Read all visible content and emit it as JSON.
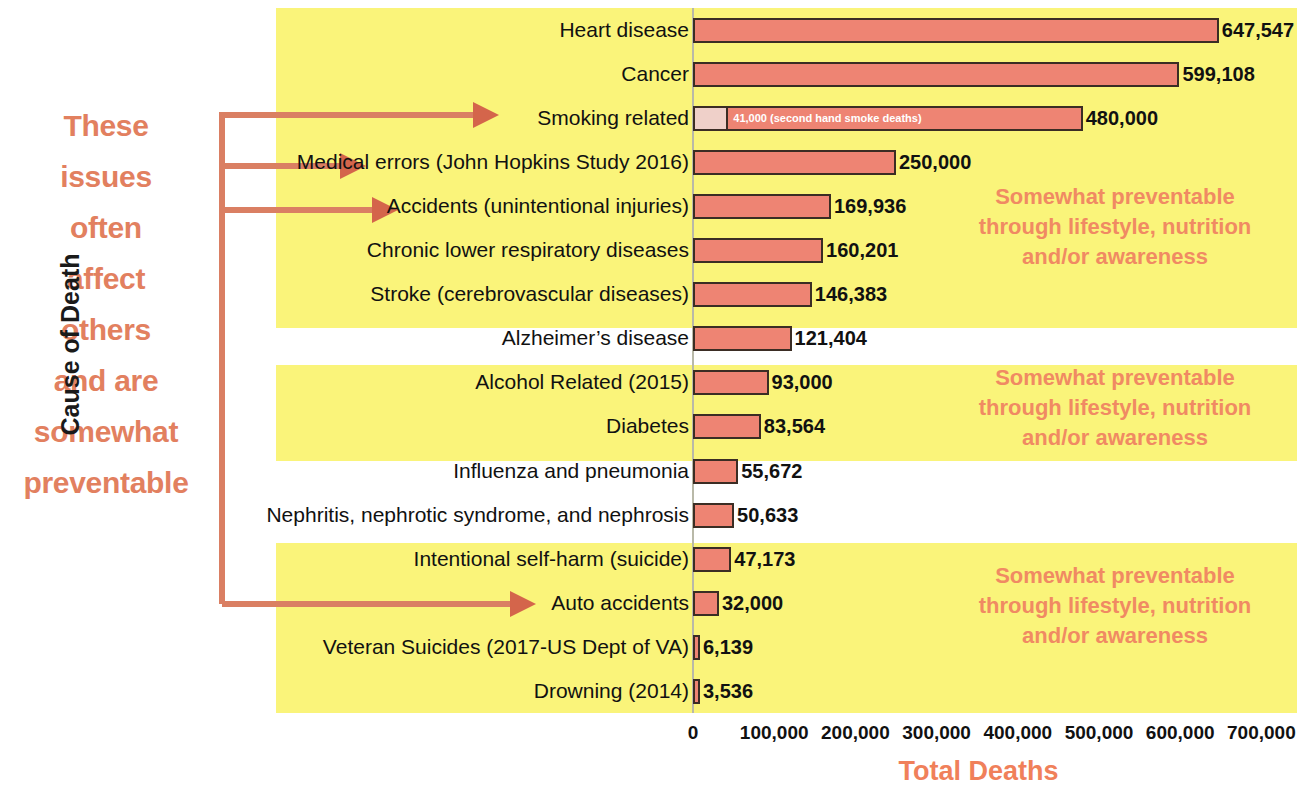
{
  "chart_data": {
    "type": "bar",
    "orientation": "horizontal",
    "title": "",
    "xlabel": "Total Deaths",
    "ylabel": "Cause of Death",
    "xlim": [
      0,
      740000
    ],
    "xticks": [
      0,
      100000,
      200000,
      300000,
      400000,
      500000,
      600000,
      700000
    ],
    "xtick_labels": [
      "0",
      "100,000",
      "200,000",
      "300,000",
      "400,000",
      "500,000",
      "600,000",
      "700,000"
    ],
    "grid": false,
    "legend": "none",
    "categories": [
      "Heart disease",
      "Cancer",
      "Smoking related",
      "Medical errors (John Hopkins Study 2016)",
      "Accidents (unintentional injuries)",
      "Chronic lower respiratory diseases",
      "Stroke (cerebrovascular diseases)",
      "Alzheimer’s disease",
      "Alcohol Related (2015)",
      "Diabetes",
      "Influenza and pneumonia",
      "Nephritis, nephrotic syndrome, and nephrosis",
      "Intentional self-harm (suicide)",
      "Auto accidents",
      "Veteran Suicides (2017-US Dept of VA)",
      "Drowning (2014)"
    ],
    "values": [
      647547,
      599108,
      480000,
      250000,
      169936,
      160201,
      146383,
      121404,
      93000,
      83564,
      55672,
      50633,
      47173,
      32000,
      6139,
      3536
    ],
    "value_labels": [
      "647,547",
      "599,108",
      "480,000",
      "250,000",
      "169,936",
      "160,201",
      "146,383",
      "121,404",
      "93,000",
      "83,564",
      "55,672",
      "50,633",
      "47,173",
      "32,000",
      "6,139",
      "3,536"
    ],
    "sub_segment": {
      "category": "Smoking related",
      "value": 41000,
      "label": "41,000 (second hand smoke deaths)"
    },
    "colors": {
      "bar_fill": "#EE8473",
      "bar_edge": "#3b2d24",
      "sub_segment_fill": "#EFD0C9",
      "highlight_band": "#FAF47A",
      "annotation_text": "#F08A63",
      "axis_title": "#F0805A",
      "bracket": "#DA7F63",
      "background": "#FFFFFF"
    }
  },
  "annotations": {
    "left_note_lines": [
      "These",
      "issues",
      "often",
      "affect",
      "others",
      "and are",
      "somewhat",
      "preventable"
    ],
    "right_notes": [
      {
        "lines": [
          "Somewhat preventable",
          "through lifestyle, nutrition",
          "and/or awareness"
        ]
      },
      {
        "lines": [
          "Somewhat preventable",
          "through lifestyle, nutrition",
          "and/or awareness"
        ]
      },
      {
        "lines": [
          "Somewhat preventable",
          "through lifestyle, nutrition",
          "and/or awareness"
        ]
      }
    ],
    "bracket_targets": [
      "Smoking related",
      "Medical errors (John Hopkins Study 2016)",
      "Accidents (unintentional injuries)",
      "Auto accidents"
    ]
  }
}
